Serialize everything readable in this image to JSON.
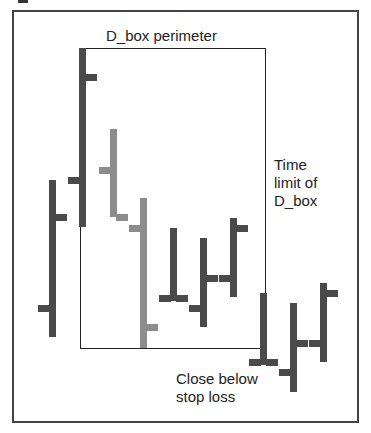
{
  "labels": {
    "top": "D_box perimeter",
    "right": "Time\nlimit of\nD_box",
    "bottom": "Close below\nstop loss"
  },
  "colors": {
    "dark": "#4a4a4a",
    "gray": "#8c8c8c",
    "frame": "#444444",
    "dbox": "#222222"
  },
  "chart_data": {
    "type": "ohlc",
    "title": "D_box perimeter",
    "annotations": [
      "D_box perimeter",
      "Time limit of D_box",
      "Close below stop loss"
    ],
    "dbox": {
      "left_bar": 2,
      "right_bar": 8,
      "top_px": 48,
      "bottom_px": 348
    },
    "bars": [
      {
        "x": 52,
        "high": 180,
        "low": 337,
        "open": 308,
        "close": 217,
        "color": "dark"
      },
      {
        "x": 82,
        "high": 48,
        "low": 227,
        "open": 180,
        "close": 77,
        "color": "dark"
      },
      {
        "x": 113,
        "high": 129,
        "low": 217,
        "open": 170,
        "close": 217,
        "color": "gray"
      },
      {
        "x": 143,
        "high": 198,
        "low": 348,
        "open": 228,
        "close": 327,
        "color": "gray"
      },
      {
        "x": 173,
        "high": 228,
        "low": 301,
        "open": 298,
        "close": 298,
        "color": "dark"
      },
      {
        "x": 203,
        "high": 238,
        "low": 327,
        "open": 308,
        "close": 278,
        "color": "dark"
      },
      {
        "x": 233,
        "high": 218,
        "low": 297,
        "open": 278,
        "close": 228,
        "color": "dark"
      },
      {
        "x": 263,
        "high": 293,
        "low": 365,
        "open": 362,
        "close": 362,
        "color": "dark"
      },
      {
        "x": 293,
        "high": 303,
        "low": 392,
        "open": 372,
        "close": 343,
        "color": "dark"
      },
      {
        "x": 323,
        "high": 283,
        "low": 362,
        "open": 343,
        "close": 293,
        "color": "dark"
      }
    ],
    "note": "Values are pixel y-positions (smaller = higher price); no axes shown."
  }
}
